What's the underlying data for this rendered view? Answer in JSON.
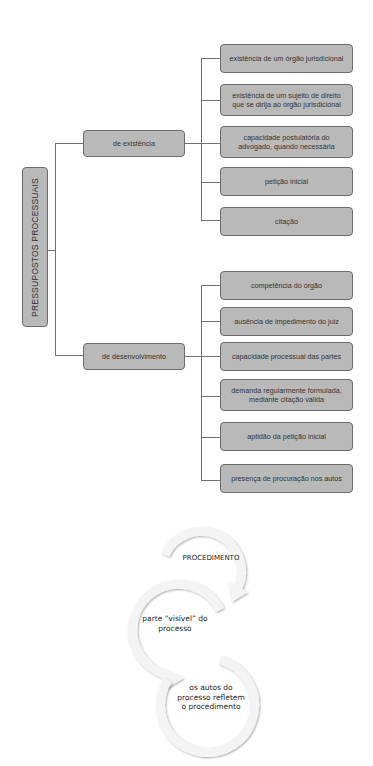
{
  "tree": {
    "root": "PRESSUPOSTOS PROCESSUAIS",
    "branches": [
      {
        "label": "de existência",
        "children": [
          "existência de um órgão jurisdicional",
          "existência de um sujeito de direito\nque se dirija ao órgão jurisdicional",
          "capacidade postulatória do\nadvogado, quando necessária",
          "petição inicial",
          "citação"
        ]
      },
      {
        "label": "de desenvolvimento",
        "children": [
          "competência do órgão",
          "ausência de impedimento do juiz",
          "capacidade processual das partes",
          "demanda regularmente formulada,\nmediante citação válida",
          "aptidão da petição inicial",
          "presença de procuração nos autos"
        ]
      }
    ]
  },
  "cycle": {
    "steps": [
      "PROCEDIMENTO",
      "parte “visível” do\nprocesso",
      "os autos do\nprocesso refletem\no procedimento"
    ]
  },
  "colors": {
    "box_fill": "#b9b9b9",
    "box_border": "#6b6b6b",
    "line": "#707070"
  }
}
